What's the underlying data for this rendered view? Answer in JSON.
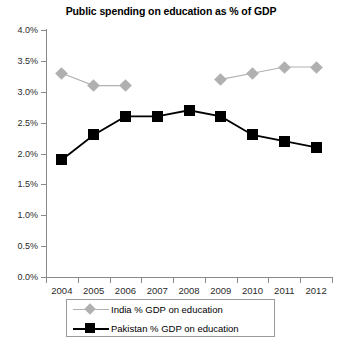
{
  "chart_data": {
    "type": "line",
    "title": "Public spending on education as % of GDP",
    "xlabel": "",
    "ylabel": "",
    "categories": [
      "2004",
      "2005",
      "2006",
      "2007",
      "2008",
      "2009",
      "2010",
      "2011",
      "2012"
    ],
    "ylim": [
      0,
      4.0
    ],
    "ytick_labels": [
      "0.0%",
      "0.5%",
      "1.0%",
      "1.5%",
      "2.0%",
      "2.5%",
      "3.0%",
      "3.5%",
      "4.0%"
    ],
    "ytick_values": [
      0.0,
      0.5,
      1.0,
      1.5,
      2.0,
      2.5,
      3.0,
      3.5,
      4.0
    ],
    "grid": false,
    "legend_position": "bottom",
    "series": [
      {
        "name": "India % GDP on education",
        "color": "#b0b0b0",
        "marker": "diamond",
        "values": [
          3.3,
          3.1,
          3.1,
          null,
          null,
          3.2,
          3.3,
          3.4,
          3.4
        ]
      },
      {
        "name": "Pakistan % GDP on education",
        "color": "#000000",
        "marker": "square",
        "values": [
          1.9,
          2.3,
          2.6,
          2.6,
          2.7,
          2.6,
          2.3,
          2.2,
          2.1
        ]
      }
    ]
  },
  "legend": {
    "items": [
      {
        "label": "India % GDP on education",
        "key": "diamond-marker-icon"
      },
      {
        "label": "Pakistan % GDP on education",
        "key": "square-marker-icon"
      }
    ]
  }
}
